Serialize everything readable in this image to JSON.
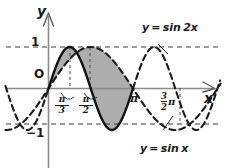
{
  "figure": {
    "kind": "math-plot",
    "background": "#ffffff",
    "ink": "#1a1a1a",
    "axis_color": "#7a7a7a",
    "shade_color": "#a8a8a8",
    "dash_color": "#3a3a3a"
  },
  "axes": {
    "y_axis_label": "y",
    "x_axis_label": "x",
    "origin_label": "O",
    "y_ticks": [
      {
        "value": 1,
        "label": "1"
      },
      {
        "value": -1,
        "label": "−1"
      }
    ],
    "x_ticks": [
      {
        "value": 1.0472,
        "label_num": "π",
        "label_den": "3",
        "type": "fraction"
      },
      {
        "value": 1.5708,
        "label_num": "π",
        "label_den": "2",
        "type": "fraction"
      },
      {
        "value": 3.1416,
        "label": "π",
        "type": "plain"
      },
      {
        "value": 4.7124,
        "label_num": "3",
        "label_den": "2",
        "label_suffix": "π",
        "type": "mixed"
      }
    ],
    "gridlines": "dashed horizontal at y = 1 and y = -1"
  },
  "curves": [
    {
      "name": "y = sin 2x",
      "label": "y = sin 2x",
      "style": "solid-and-dashed",
      "amplitude": 1,
      "period": 3.1416
    },
    {
      "name": "y = sin x",
      "label": "y = sin x",
      "style": "dashed",
      "amplitude": 1,
      "period": 6.2832
    }
  ],
  "chart_data": {
    "type": "line",
    "title": "",
    "xlabel": "x",
    "ylabel": "y",
    "xlim": [
      -1.6,
      6.4
    ],
    "ylim": [
      -1.35,
      1.35
    ],
    "grid": "dashed y=1 and y=-1 only",
    "legend": "inline curve labels",
    "annotations": [
      {
        "text": "y = sin 2x",
        "points_to_curve": "y = sin 2x",
        "position": "top-right"
      },
      {
        "text": "y = sin x",
        "points_to_curve": "y = sin x",
        "position": "bottom-right"
      }
    ],
    "shaded_regions": [
      {
        "between": [
          "y = sin 2x",
          "y = sin x"
        ],
        "from_x": 0,
        "to_x": 1.0472,
        "note": "sin2x above sinx"
      },
      {
        "between": [
          "y = sin 2x",
          "y = sin x"
        ],
        "from_x": 1.0472,
        "to_x": 3.1416,
        "note": "sinx above sin2x"
      }
    ],
    "series": [
      {
        "name": "y = sin 2x",
        "expression": "sin(2x)",
        "dash": "solid on [0, pi], dashed elsewhere",
        "x": [
          -1.6,
          -1.4,
          -1.2,
          -1.0,
          -0.8,
          -0.6,
          -0.4,
          -0.2,
          0.0,
          0.2,
          0.4,
          0.6,
          0.8,
          1.0,
          1.2,
          1.4,
          1.6,
          1.8,
          2.0,
          2.2,
          2.4,
          2.6,
          2.8,
          3.0,
          3.1416,
          3.4,
          3.6,
          3.8,
          4.0,
          4.2,
          4.4,
          4.6,
          4.8,
          5.0,
          5.2,
          5.4,
          5.6,
          5.8,
          6.0,
          6.2,
          6.4
        ],
        "y": [
          0.0584,
          -0.335,
          -0.6755,
          -0.9093,
          -0.9996,
          -0.932,
          -0.7174,
          -0.3894,
          0.0,
          0.3894,
          0.7174,
          0.932,
          0.9996,
          0.9093,
          0.6755,
          0.335,
          -0.0584,
          -0.4425,
          -0.7568,
          -0.9516,
          -0.9962,
          -0.8835,
          -0.6313,
          -0.2794,
          0.0,
          0.4941,
          0.7728,
          0.9516,
          0.9894,
          0.8716,
          0.6119,
          0.2513,
          -0.1165,
          -0.544,
          -0.8323,
          -0.9813,
          -0.9727,
          -0.8118,
          -0.5366,
          -0.1822,
          0.2174
        ]
      },
      {
        "name": "y = sin x",
        "expression": "sin(x)",
        "dash": "dashed throughout",
        "x": [
          -1.6,
          -1.4,
          -1.2,
          -1.0,
          -0.8,
          -0.6,
          -0.4,
          -0.2,
          0.0,
          0.2,
          0.4,
          0.6,
          0.8,
          1.0,
          1.2,
          1.4,
          1.5708,
          1.8,
          2.0,
          2.2,
          2.4,
          2.6,
          2.8,
          3.0,
          3.1416,
          3.4,
          3.6,
          3.8,
          4.0,
          4.2,
          4.4,
          4.6,
          4.7124,
          5.0,
          5.2,
          5.4,
          5.6,
          5.8,
          6.0,
          6.2,
          6.4
        ],
        "y": [
          -0.9996,
          -0.9854,
          -0.932,
          -0.8415,
          -0.7174,
          -0.5646,
          -0.3894,
          -0.1987,
          0.0,
          0.1987,
          0.3894,
          0.5646,
          0.7174,
          0.8415,
          0.932,
          0.9854,
          1.0,
          0.9738,
          0.9093,
          0.8085,
          0.6755,
          0.5155,
          0.335,
          0.1411,
          0.0,
          -0.2555,
          -0.4425,
          -0.6119,
          -0.7568,
          -0.8716,
          -0.9516,
          -0.9937,
          -1.0,
          -0.9589,
          -0.8835,
          -0.7728,
          -0.6313,
          -0.4646,
          -0.2794,
          -0.0831,
          0.1165
        ]
      }
    ]
  }
}
